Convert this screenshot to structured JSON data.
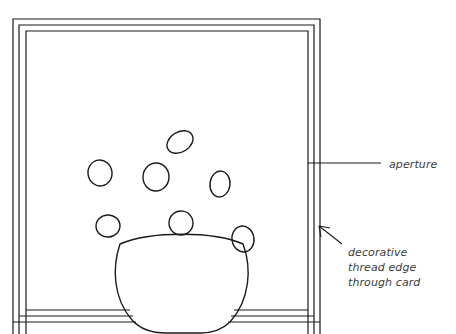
{
  "figure": {
    "background_color": "#ffffff",
    "line_color": "#1a1a1a",
    "text_color": "#3b3b3b",
    "width": 456,
    "height": 334
  },
  "annotations": {
    "aperture": {
      "text": "aperture",
      "leader": {
        "x1": 308,
        "y1": 163,
        "x2": 381,
        "y2": 163
      }
    },
    "thread_edge": {
      "line1": "decorative",
      "line2": "thread edge",
      "line3": "through card",
      "arrow": {
        "x1": 341,
        "y1": 243,
        "x2": 319,
        "y2": 226
      }
    }
  },
  "frame": {
    "name": "card-mount-frame",
    "rings": [
      {
        "x": 13,
        "y": 19,
        "w": 307,
        "h": 315
      },
      {
        "x": 19,
        "y": 25,
        "w": 295,
        "h": 309
      },
      {
        "x": 26,
        "y": 31,
        "w": 282,
        "h": 303
      }
    ]
  },
  "vase": {
    "name": "vase-bowl",
    "rim_left_x": 120,
    "rim_right_x": 243,
    "rim_y": 244,
    "rim_dip_y": 233,
    "base_y": 330,
    "base_left_x": 146,
    "base_right_x": 218
  },
  "flowers": [
    {
      "id": "flower-top",
      "cx": 180,
      "cy": 142,
      "rx": 14,
      "ry": 10,
      "rot": -32
    },
    {
      "id": "flower-left",
      "cx": 100,
      "cy": 173,
      "rx": 12,
      "ry": 13,
      "rot": -8
    },
    {
      "id": "flower-middle",
      "cx": 156,
      "cy": 177,
      "rx": 13,
      "ry": 14,
      "rot": 4
    },
    {
      "id": "flower-right",
      "cx": 220,
      "cy": 184,
      "rx": 10,
      "ry": 13,
      "rot": 6
    },
    {
      "id": "flower-lower-left",
      "cx": 108,
      "cy": 226,
      "rx": 12,
      "ry": 11,
      "rot": -4
    },
    {
      "id": "flower-lower-mid",
      "cx": 181,
      "cy": 223,
      "rx": 12,
      "ry": 12,
      "rot": 10
    },
    {
      "id": "flower-lower-right",
      "cx": 243,
      "cy": 239,
      "rx": 11,
      "ry": 13,
      "rot": -10
    }
  ]
}
